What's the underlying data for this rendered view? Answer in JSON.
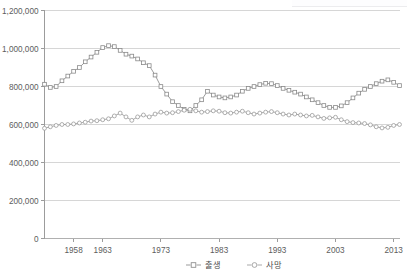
{
  "chart_data": {
    "type": "line",
    "title": "",
    "xlabel": "",
    "ylabel": "",
    "ylim": [
      0,
      1200000
    ],
    "xlim": [
      1953,
      2014
    ],
    "grid": true,
    "legend_position": "bottom",
    "y_ticks": [
      0,
      200000,
      400000,
      600000,
      800000,
      1000000,
      1200000
    ],
    "y_tick_labels": [
      "0",
      "200,000",
      "400,000",
      "600,000",
      "800,000",
      "1,000,000",
      "1,200,000"
    ],
    "x_ticks": [
      1958,
      1963,
      1973,
      1983,
      1993,
      2003,
      2013
    ],
    "x_tick_labels": [
      "1958",
      "1963",
      "1973",
      "1983",
      "1993",
      "2003",
      "2013"
    ],
    "x": [
      1953,
      1954,
      1955,
      1956,
      1957,
      1958,
      1959,
      1960,
      1961,
      1962,
      1963,
      1964,
      1965,
      1966,
      1967,
      1968,
      1969,
      1970,
      1971,
      1972,
      1973,
      1974,
      1975,
      1976,
      1977,
      1978,
      1979,
      1980,
      1981,
      1982,
      1983,
      1984,
      1985,
      1986,
      1987,
      1988,
      1989,
      1990,
      1991,
      1992,
      1993,
      1994,
      1995,
      1996,
      1997,
      1998,
      1999,
      2000,
      2001,
      2002,
      2003,
      2004,
      2005,
      2006,
      2007,
      2008,
      2009,
      2010,
      2011,
      2012,
      2013,
      2014
    ],
    "series": [
      {
        "name": "출생",
        "marker": "square",
        "color": "#8a8a8a",
        "values": [
          812000,
          795000,
          800000,
          830000,
          855000,
          880000,
          900000,
          930000,
          955000,
          980000,
          1005000,
          1015000,
          1010000,
          990000,
          970000,
          960000,
          945000,
          925000,
          910000,
          860000,
          800000,
          760000,
          720000,
          700000,
          680000,
          672000,
          700000,
          730000,
          775000,
          755000,
          745000,
          740000,
          745000,
          755000,
          775000,
          790000,
          800000,
          810000,
          817000,
          815000,
          805000,
          790000,
          780000,
          770000,
          760000,
          745000,
          730000,
          715000,
          700000,
          690000,
          690000,
          698000,
          715000,
          740000,
          765000,
          785000,
          800000,
          815000,
          828000,
          835000,
          822000,
          805000
        ]
      },
      {
        "name": "사망",
        "marker": "circle",
        "color": "#9a9a9a",
        "values": [
          580000,
          588000,
          595000,
          600000,
          600000,
          603000,
          608000,
          612000,
          618000,
          620000,
          625000,
          630000,
          645000,
          660000,
          640000,
          622000,
          640000,
          650000,
          640000,
          655000,
          665000,
          660000,
          662000,
          668000,
          675000,
          680000,
          672000,
          665000,
          668000,
          672000,
          670000,
          662000,
          660000,
          665000,
          670000,
          662000,
          655000,
          660000,
          665000,
          668000,
          662000,
          655000,
          650000,
          655000,
          650000,
          645000,
          648000,
          640000,
          632000,
          635000,
          638000,
          625000,
          615000,
          610000,
          608000,
          605000,
          598000,
          588000,
          582000,
          585000,
          595000,
          600000
        ]
      }
    ]
  },
  "legend": {
    "items": [
      {
        "label": "출생",
        "marker": "square"
      },
      {
        "label": "사망",
        "marker": "circle"
      }
    ]
  },
  "axis": {
    "y_max_label": "1,200,000",
    "y_min_label": "0"
  }
}
